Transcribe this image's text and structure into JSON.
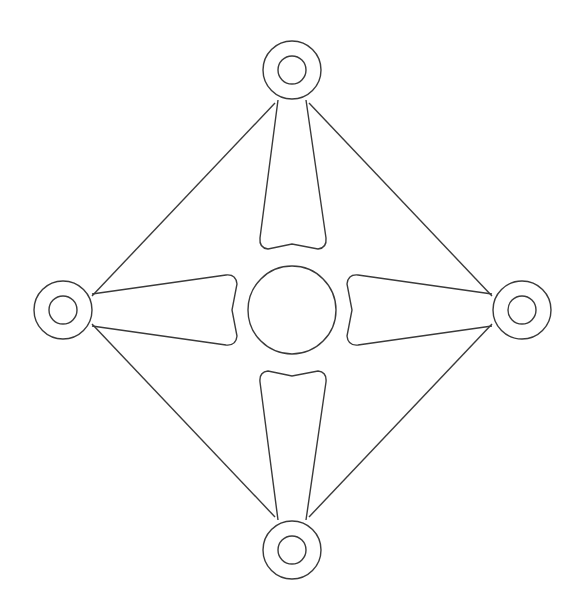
{
  "diagram": {
    "type": "line-drawing",
    "stroke_color": "#3a3a3a",
    "background": "#ffffff",
    "center_circle": {
      "cx": 292,
      "cy": 310,
      "r": 44
    },
    "rings": [
      {
        "name": "top",
        "cx": 292,
        "cy": 70,
        "r_outer": 29,
        "r_inner": 14
      },
      {
        "name": "left",
        "cx": 63,
        "cy": 310,
        "r_outer": 29,
        "r_inner": 14
      },
      {
        "name": "right",
        "cx": 522,
        "cy": 310,
        "r_outer": 29,
        "r_inner": 14
      },
      {
        "name": "bottom",
        "cx": 292,
        "cy": 550,
        "r_outer": 29,
        "r_inner": 14
      }
    ]
  }
}
